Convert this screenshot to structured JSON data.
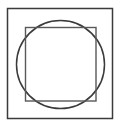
{
  "figure": {
    "canvas": {
      "width": 120,
      "height": 127,
      "background_color": "#ffffff"
    },
    "shapes": [
      {
        "name": "outer-square",
        "type": "rect",
        "x": 7.5,
        "y": 8.5,
        "width": 105,
        "height": 110,
        "stroke_color": "#3b3b3b",
        "stroke_width": 1.5,
        "fill": "none"
      },
      {
        "name": "circle",
        "type": "circle",
        "cx": 60.5,
        "cy": 64.5,
        "r": 44,
        "stroke_color": "#3b3b3b",
        "stroke_width": 1.5,
        "fill": "none"
      },
      {
        "name": "inner-square",
        "type": "rect",
        "x": 25.5,
        "y": 27.5,
        "width": 70.5,
        "height": 73.5,
        "stroke_color": "#585858",
        "stroke_width": 1.4,
        "fill": "none"
      }
    ]
  }
}
